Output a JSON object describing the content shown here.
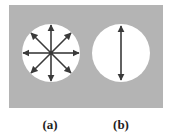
{
  "figure": {
    "background_color": "#b4b4b4",
    "circle_color": "#ffffff",
    "arrow_color": "#3a3a3a",
    "panels": [
      {
        "id": "a",
        "label": "(a)",
        "arrows": "eight directions (radial, 45° apart)"
      },
      {
        "id": "b",
        "label": "(b)",
        "arrows": "single vertical double-headed arrow"
      }
    ]
  }
}
